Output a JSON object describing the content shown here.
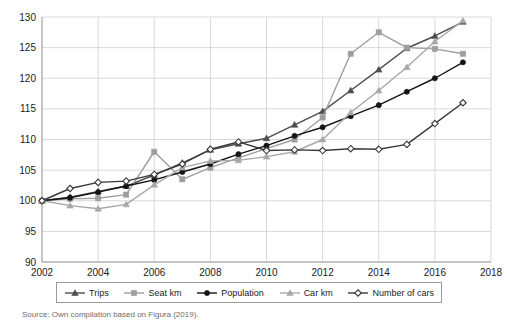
{
  "caption": "Source: Own compilation based on Figura (2019).",
  "legend": {
    "entries": [
      {
        "label": "Trips",
        "marker": "triangle",
        "color": "#4d4d4d",
        "name": "legend-item-trips"
      },
      {
        "label": "Seat km",
        "marker": "square",
        "color": "#9e9e9e",
        "name": "legend-item-seat-km"
      },
      {
        "label": "Population",
        "marker": "circle",
        "color": "#141414",
        "name": "legend-item-population"
      },
      {
        "label": "Car km",
        "marker": "triangle",
        "color": "#a8a8a8",
        "name": "legend-item-car-km"
      },
      {
        "label": "Number of cars",
        "marker": "diamond",
        "color": "#3a3a3a",
        "name": "legend-item-number-of-cars"
      }
    ]
  },
  "chart_data": {
    "type": "line",
    "title": "",
    "xlabel": "",
    "ylabel": "",
    "xlim": [
      2002,
      2018
    ],
    "ylim": [
      90,
      130
    ],
    "xticks": [
      2002,
      2004,
      2006,
      2008,
      2010,
      2012,
      2014,
      2016,
      2018
    ],
    "yticks": [
      90,
      95,
      100,
      105,
      110,
      115,
      120,
      125,
      130
    ],
    "grid": true,
    "legend_position": "bottom",
    "x": [
      2002,
      2003,
      2004,
      2005,
      2006,
      2007,
      2008,
      2009,
      2010,
      2011,
      2012,
      2013,
      2014,
      2015,
      2016,
      2017
    ],
    "series": [
      {
        "name": "Trips",
        "marker": "triangle",
        "color": "#4d4d4d",
        "values": [
          100.0,
          100.6,
          101.5,
          102.4,
          104.2,
          106.2,
          108.3,
          109.3,
          110.2,
          112.4,
          114.6,
          118.0,
          121.4,
          124.9,
          126.9,
          129.2
        ]
      },
      {
        "name": "Seat km",
        "marker": "square",
        "color": "#9e9e9e",
        "values": [
          100.0,
          100.3,
          100.4,
          101.0,
          108.0,
          103.5,
          105.4,
          107.0,
          108.5,
          110.0,
          113.6,
          124.0,
          127.5,
          125.0,
          124.8,
          124.0
        ]
      },
      {
        "name": "Population",
        "marker": "circle",
        "color": "#141414",
        "values": [
          100.0,
          100.5,
          101.4,
          102.4,
          103.4,
          104.7,
          106.0,
          107.6,
          109.0,
          110.6,
          112.0,
          113.8,
          115.6,
          117.8,
          120.0,
          122.6
        ]
      },
      {
        "name": "Car km",
        "marker": "triangle",
        "color": "#a8a8a8",
        "values": [
          100.0,
          99.2,
          98.7,
          99.4,
          102.6,
          105.4,
          106.5,
          106.6,
          107.2,
          108.0,
          110.0,
          114.4,
          118.0,
          121.8,
          126.0,
          129.4
        ]
      },
      {
        "name": "Number of cars",
        "marker": "diamond",
        "color": "#3a3a3a",
        "values": [
          100.0,
          102.0,
          103.0,
          103.2,
          104.3,
          106.0,
          108.4,
          109.6,
          108.2,
          108.3,
          108.2,
          108.5,
          108.4,
          109.2,
          112.6,
          116.0
        ]
      }
    ]
  }
}
